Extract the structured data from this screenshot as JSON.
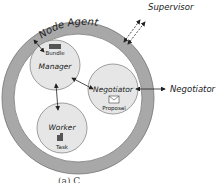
{
  "diagram": {
    "outer_ring": {
      "label": "Node Agent",
      "color": "#a8a8a8"
    },
    "nodes": [
      {
        "id": "manager",
        "label": "Manager",
        "icon_label": "Bundle",
        "icon": "bundle-icon"
      },
      {
        "id": "negotiator",
        "label": "Negotiator",
        "icon_label": "Proposal",
        "icon": "envelope-icon"
      },
      {
        "id": "worker",
        "label": "Worker",
        "icon_label": "Task",
        "icon": "task-icon"
      }
    ],
    "external": {
      "supervisor": "Supervisor",
      "negotiator": "Negotiator"
    },
    "caption": "(a) C",
    "colors": {
      "node_fill": "#e6e6e6",
      "node_stroke": "#888888",
      "ring": "#a8a8a8"
    }
  }
}
